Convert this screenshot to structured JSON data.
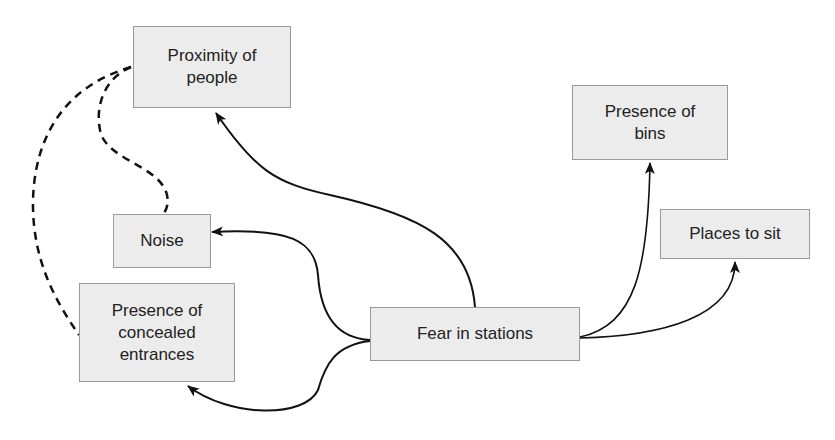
{
  "diagram": {
    "type": "concept-map",
    "colors": {
      "node_fill": "#ececec",
      "node_border": "#9a9a9a",
      "text": "#222222",
      "edge": "#111111"
    },
    "nodes": {
      "proximity": {
        "label": "Proximity of\npeople"
      },
      "bins": {
        "label": "Presence of\nbins"
      },
      "noise": {
        "label": "Noise"
      },
      "places": {
        "label": "Places to sit"
      },
      "concealed": {
        "label": "Presence of\nconcealed\nentrances"
      },
      "fear": {
        "label": "Fear in stations"
      }
    },
    "edges": [
      {
        "from": "Fear in stations",
        "to": "Proximity of people",
        "style": "solid-arrow"
      },
      {
        "from": "Fear in stations",
        "to": "Noise",
        "style": "solid-arrow"
      },
      {
        "from": "Fear in stations",
        "to": "Presence of concealed entrances",
        "style": "solid-arrow"
      },
      {
        "from": "Fear in stations",
        "to": "Presence of bins",
        "style": "solid-arrow"
      },
      {
        "from": "Fear in stations",
        "to": "Places to sit",
        "style": "solid-arrow"
      },
      {
        "from": "Proximity of people",
        "to": "Noise",
        "style": "dashed"
      },
      {
        "from": "Proximity of people",
        "to": "Presence of concealed entrances",
        "style": "dashed"
      }
    ]
  }
}
